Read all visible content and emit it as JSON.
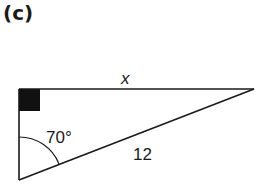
{
  "part_label": "(c)",
  "triangle": {
    "type": "right-angled triangle",
    "vertices": {
      "right_angle": [
        19,
        89
      ],
      "acute_top_right": [
        254,
        89
      ],
      "angle_vertex_bottom": [
        19,
        180
      ]
    },
    "sides": {
      "top": {
        "label": "x"
      },
      "hypotenuse": {
        "label": "12"
      }
    },
    "angle": {
      "label": "70°",
      "at": "bottom-left vertex"
    },
    "right_angle_marker": "filled square"
  },
  "colors": {
    "line": "#1a1a1a",
    "background": "#ffffff"
  }
}
